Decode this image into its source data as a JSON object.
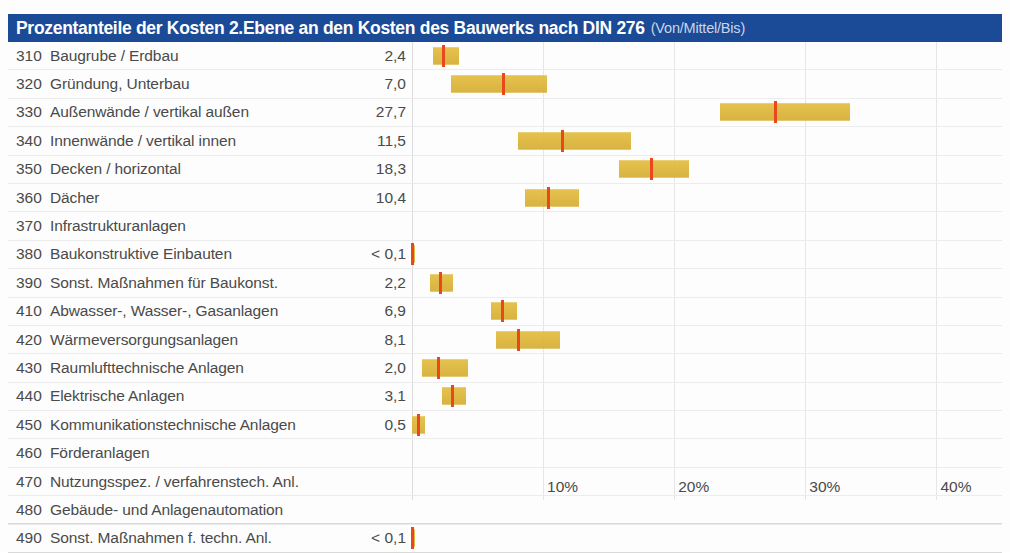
{
  "header": {
    "title_main": "Prozentanteile der Kosten 2.Ebene an den Kosten des Bauwerks nach DIN 276",
    "title_sub": "(Von/Mittel/Bis)",
    "bar_color": "#1b4a97",
    "title_color": "#ffffff",
    "subtitle_color": "#c9d6ea"
  },
  "colors": {
    "bar_fill": "#dcb437",
    "marker": "#e8481c",
    "text": "#4a4a4a",
    "gridline": "#e6e6e6"
  },
  "chart_data": {
    "type": "bar",
    "title": "Prozentanteile der Kosten 2.Ebene an den Kosten des Bauwerks nach DIN 276 (Von/Mittel/Bis)",
    "xlabel": "",
    "ylabel": "",
    "xlim": [
      0,
      45
    ],
    "grid": true,
    "legend": "none",
    "xticks": [
      0,
      10,
      20,
      30,
      40
    ],
    "xticklabels": [
      "",
      "10%",
      "20%",
      "30%",
      "40%"
    ],
    "value_format": "German decimal comma",
    "categories": [
      {
        "code": "310",
        "label": "Baugrube / Erdbau",
        "value_text": "2,4",
        "von": 1.6,
        "mittel": 2.4,
        "bis": 3.6
      },
      {
        "code": "320",
        "label": "Gründung, Unterbau",
        "value_text": "7,0",
        "von": 3.0,
        "mittel": 7.0,
        "bis": 10.3
      },
      {
        "code": "330",
        "label": "Außenwände / vertikal außen",
        "value_text": "27,7",
        "von": 23.5,
        "mittel": 27.7,
        "bis": 33.4
      },
      {
        "code": "340",
        "label": "Innenwände / vertikal innen",
        "value_text": "11,5",
        "von": 8.1,
        "mittel": 11.5,
        "bis": 16.7
      },
      {
        "code": "350",
        "label": "Decken / horizontal",
        "value_text": "18,3",
        "von": 15.8,
        "mittel": 18.3,
        "bis": 21.1
      },
      {
        "code": "360",
        "label": "Dächer",
        "value_text": "10,4",
        "von": 8.6,
        "mittel": 10.4,
        "bis": 12.7
      },
      {
        "code": "370",
        "label": "Infrastrukturanlagen",
        "value_text": "",
        "von": null,
        "mittel": null,
        "bis": null
      },
      {
        "code": "380",
        "label": "Baukonstruktive Einbauten",
        "value_text": "< 0,1",
        "von": 0.0,
        "mittel": 0.05,
        "bis": 0.1
      },
      {
        "code": "390",
        "label": "Sonst. Maßnahmen für Baukonst.",
        "value_text": "2,2",
        "von": 1.4,
        "mittel": 2.2,
        "bis": 3.1
      },
      {
        "code": "410",
        "label": "Abwasser-, Wasser-, Gasanlagen",
        "value_text": "6,9",
        "von": 6.0,
        "mittel": 6.9,
        "bis": 8.0
      },
      {
        "code": "420",
        "label": "Wärmeversorgungsanlagen",
        "value_text": "8,1",
        "von": 6.4,
        "mittel": 8.1,
        "bis": 11.3
      },
      {
        "code": "430",
        "label": "Raumlufttechnische Anlagen",
        "value_text": "2,0",
        "von": 0.8,
        "mittel": 2.0,
        "bis": 4.3
      },
      {
        "code": "440",
        "label": "Elektrische Anlagen",
        "value_text": "3,1",
        "von": 2.3,
        "mittel": 3.1,
        "bis": 4.1
      },
      {
        "code": "450",
        "label": "Kommunikationstechnische Anlagen",
        "value_text": "0,5",
        "von": 0.0,
        "mittel": 0.5,
        "bis": 1.0
      },
      {
        "code": "460",
        "label": "Förderanlagen",
        "value_text": "",
        "von": null,
        "mittel": null,
        "bis": null
      },
      {
        "code": "470",
        "label": "Nutzungsspez. / verfahrenstech. Anl.",
        "value_text": "",
        "von": null,
        "mittel": null,
        "bis": null
      },
      {
        "code": "480",
        "label": "Gebäude- und Anlagenautomation",
        "value_text": "",
        "von": null,
        "mittel": null,
        "bis": null
      },
      {
        "code": "490",
        "label": "Sonst. Maßnahmen f. techn. Anl.",
        "value_text": "< 0,1",
        "von": 0.0,
        "mittel": 0.05,
        "bis": 0.1
      }
    ]
  }
}
